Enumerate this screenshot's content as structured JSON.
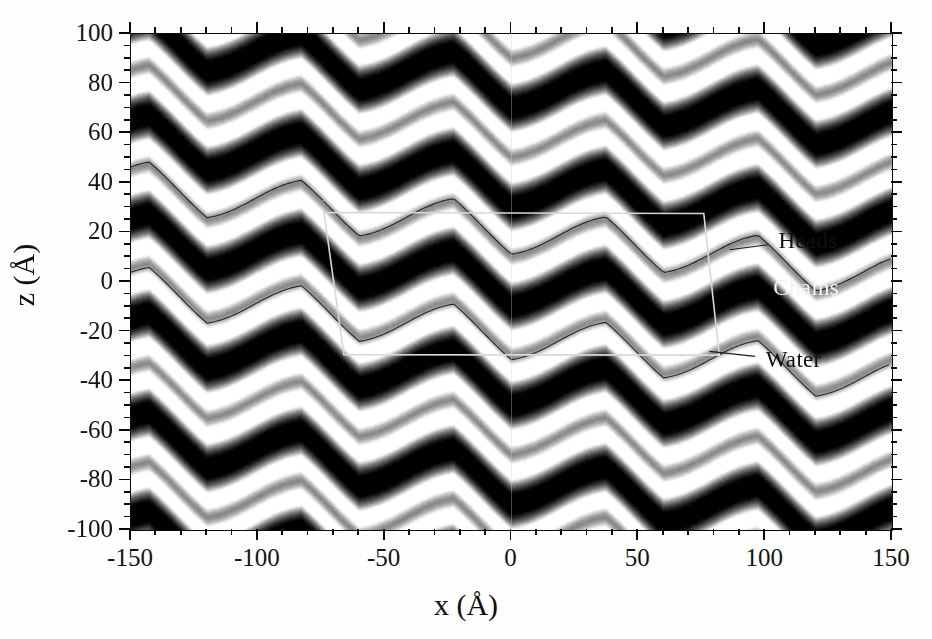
{
  "figure": {
    "type": "grayscale-density-map"
  },
  "axes": {
    "x": {
      "title": "x (Å)",
      "min": -150,
      "max": 150,
      "major_ticks": [
        -150,
        -100,
        -50,
        0,
        50,
        100,
        150
      ],
      "major_tick_labels": [
        "-150",
        "-100",
        "-50",
        "0",
        "50",
        "100",
        "150"
      ],
      "minor_tick_step": 10
    },
    "y": {
      "title": "z (Å)",
      "min": -100,
      "max": 100,
      "major_ticks": [
        100,
        80,
        60,
        40,
        20,
        0,
        -20,
        -40,
        -60,
        -80,
        -100
      ],
      "major_tick_labels": [
        "100",
        "80",
        "60",
        "40",
        "20",
        "0",
        "-20",
        "-40",
        "-60",
        "-80",
        "-100"
      ],
      "minor_tick_step": 5
    }
  },
  "annotations": [
    {
      "id": "heads",
      "label": "Heads",
      "x": 106,
      "z": 16,
      "style": "dark"
    },
    {
      "id": "chains",
      "label": "Chains",
      "x": 104,
      "z": -3,
      "style": "light"
    },
    {
      "id": "water",
      "label": "Water",
      "x": 101,
      "z": -32,
      "style": "dark"
    }
  ],
  "unit_cell_box": {
    "label": "unit-cell-outline",
    "color": "#d8d8d8",
    "corners_data": [
      {
        "x": -73.9,
        "z": 28.0
      },
      {
        "x": 75.8,
        "z": 27.6
      },
      {
        "x": 81.9,
        "z": -29.5
      },
      {
        "x": -66.1,
        "z": -29.3
      }
    ]
  },
  "chart_data": {
    "type": "heatmap",
    "title": "",
    "xlabel": "x (Å)",
    "ylabel": "z (Å)",
    "xlim": [
      -150,
      150
    ],
    "ylim": [
      -100,
      100
    ],
    "grid": false,
    "colormap": "grayscale",
    "colormap_low": "#000000",
    "colormap_high": "#ffffff",
    "model": {
      "lamellar_period_A": 40.0,
      "ripple_period_A": 60.0,
      "ripple_amplitude_A": 10.0,
      "ripple_tilt_deg": -7.0,
      "sawtooth_asymmetry": 0.62,
      "headgroup_peak_offset_A": 18.0,
      "bilayer_center_offset_A": 0.0,
      "noise_level": 0.085
    },
    "layer_features": [
      {
        "name": "Heads",
        "description": "bright high-density headgroup bands",
        "z_offsets_A": [
          -18,
          18
        ]
      },
      {
        "name": "Chains",
        "description": "dark low-density hydrocarbon core",
        "z_offsets_A": [
          0
        ]
      },
      {
        "name": "Water",
        "description": "intermediate density water layer",
        "z_offsets_A": [
          20,
          -20
        ]
      }
    ],
    "bright_band_centers_z_A": [
      -92,
      -72,
      -52,
      -32,
      -12,
      8,
      28,
      48,
      68,
      88
    ],
    "dark_band_centers_z_A": [
      -80,
      -40,
      0,
      40,
      80
    ]
  },
  "contour_traces": [
    {
      "id": "trace-upper-heads",
      "z_center_A": 14.5,
      "note": "thin dark contour along top head band inside and right of the box"
    },
    {
      "id": "trace-lower-heads",
      "z_center_A": -21.0,
      "note": "thin dark contour along lower head band"
    },
    {
      "id": "trace-far-left-upper",
      "z_center_A": 22.0,
      "note": "left portion upper contour"
    },
    {
      "id": "trace-far-left-lower",
      "z_center_A": -22.0,
      "note": "left portion lower contour"
    }
  ],
  "leader_lines": [
    {
      "for": "heads",
      "from_x_A": 86,
      "from_z_A": 13,
      "to_x_A": 101,
      "to_z_A": 15
    },
    {
      "for": "water",
      "from_x_A": 78,
      "from_z_A": -28,
      "to_x_A": 96,
      "to_z_A": -30
    }
  ]
}
